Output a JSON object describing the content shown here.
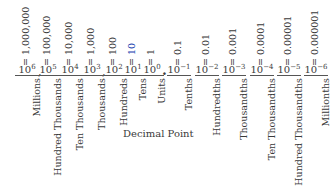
{
  "diagram": {
    "decimal_point_label": "Decimal Point",
    "columns": [
      {
        "name": "Millions",
        "base": "10",
        "exp": "6",
        "value": "= 1,000,000"
      },
      {
        "name": "Hundred Thousands",
        "base": "10",
        "exp": "5",
        "value": "= 100,000"
      },
      {
        "name": "Ten Thousands",
        "base": "10",
        "exp": "4",
        "value": "= 10,000"
      },
      {
        "name": "Thousands",
        "base": "10",
        "exp": "3",
        "value": "= 1,000"
      },
      {
        "name": "Hundreds",
        "base": "10",
        "exp": "2",
        "value": "= 100"
      },
      {
        "name": "Tens",
        "base": "10",
        "exp": "1",
        "value": "= 10",
        "value_color": "#1a3fb0"
      },
      {
        "name": "Units",
        "base": "10",
        "exp": "0",
        "value": "= 1"
      },
      {
        "name": "Tenths",
        "base": "10",
        "exp": "−1",
        "value": "= 0.1"
      },
      {
        "name": "Hundredths",
        "base": "10",
        "exp": "−2",
        "value": "= 0.01"
      },
      {
        "name": "Thousandths",
        "base": "10",
        "exp": "−3",
        "value": "= 0.001"
      },
      {
        "name": "Ten Thousandths",
        "base": "10",
        "exp": "−4",
        "value": "= 0.0001"
      },
      {
        "name": "Hundred Thousandths",
        "base": "10",
        "exp": "−5",
        "value": "= 0.00001"
      },
      {
        "name": "Millionths",
        "base": "10",
        "exp": "−6",
        "value": "= 0.000001"
      }
    ],
    "separators": {
      "comma": ",",
      "point": "."
    }
  }
}
